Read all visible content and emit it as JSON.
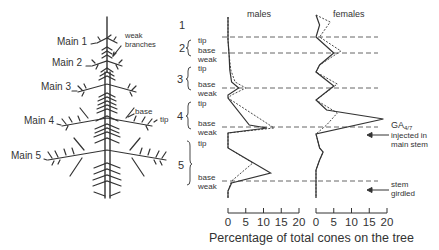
{
  "tree": {
    "labels": [
      {
        "text": "Main 1",
        "x": 57,
        "y": 45
      },
      {
        "text": "Main 2",
        "x": 52,
        "y": 66
      },
      {
        "text": "Main 3",
        "x": 41,
        "y": 90
      },
      {
        "text": "Main 4",
        "x": 24,
        "y": 124
      },
      {
        "text": "Main 5",
        "x": 11,
        "y": 159
      }
    ],
    "annotations": {
      "weak_branches_1": "weak",
      "weak_branches_2": "branches",
      "base": "base",
      "tip": "tip"
    }
  },
  "sections": [
    {
      "num": "1",
      "y": 27,
      "sub": []
    },
    {
      "num": "2",
      "y": 49,
      "sub": [
        {
          "t": "tip",
          "y": 43
        },
        {
          "t": "base",
          "y": 53
        },
        {
          "t": "weak",
          "y": 62
        }
      ]
    },
    {
      "num": "3",
      "y": 80,
      "sub": [
        {
          "t": "tip",
          "y": 71
        },
        {
          "t": "base",
          "y": 87
        },
        {
          "t": "weak",
          "y": 96
        }
      ]
    },
    {
      "num": "4",
      "y": 117,
      "sub": [
        {
          "t": "tip",
          "y": 106
        },
        {
          "t": "base",
          "y": 126
        },
        {
          "t": "weak",
          "y": 135
        }
      ]
    },
    {
      "num": "5",
      "y": 166,
      "sub": [
        {
          "t": "tip",
          "y": 146
        },
        {
          "t": "base",
          "y": 180
        },
        {
          "t": "weak",
          "y": 189
        }
      ]
    }
  ],
  "chart_data": {
    "type": "line",
    "title": "",
    "xlabel": "Percentage of total cones on the tree",
    "panels": [
      {
        "name": "males",
        "xlim": [
          0,
          20
        ],
        "xticks": [
          "0",
          "5",
          "10",
          "15",
          "20"
        ],
        "series": [
          {
            "name": "control (solid)",
            "style": "solid",
            "points": [
              [
                0,
                17
              ],
              [
                0,
                40
              ],
              [
                0.3,
                55
              ],
              [
                0.5,
                70
              ],
              [
                1,
                82
              ],
              [
                3,
                88
              ],
              [
                0,
                95
              ],
              [
                0,
                98
              ],
              [
                6,
                125
              ],
              [
                11,
                128
              ],
              [
                0,
                133
              ],
              [
                0,
                148
              ],
              [
                12,
                173
              ],
              [
                1,
                183
              ],
              [
                0,
                191
              ],
              [
                0,
                198
              ]
            ]
          },
          {
            "name": "treated (dashed)",
            "style": "dashed",
            "points": [
              [
                0,
                17
              ],
              [
                0,
                40
              ],
              [
                0.3,
                55
              ],
              [
                0.8,
                70
              ],
              [
                2,
                82
              ],
              [
                5,
                88
              ],
              [
                1,
                95
              ],
              [
                0,
                98
              ],
              [
                13,
                128
              ],
              [
                0,
                133
              ],
              [
                0,
                148
              ],
              [
                7,
                163
              ],
              [
                1,
                181
              ],
              [
                0,
                191
              ],
              [
                0,
                198
              ]
            ]
          }
        ]
      },
      {
        "name": "females",
        "xlim": [
          0,
          20
        ],
        "xticks": [
          "0",
          "5",
          "10",
          "15",
          "20"
        ],
        "series": [
          {
            "name": "control (solid)",
            "style": "solid",
            "points": [
              [
                0,
                15
              ],
              [
                1,
                25
              ],
              [
                0,
                37
              ],
              [
                5,
                53
              ],
              [
                1,
                65
              ],
              [
                0,
                72
              ],
              [
                5,
                86
              ],
              [
                0,
                100
              ],
              [
                3,
                110
              ],
              [
                19,
                119
              ],
              [
                0,
                134
              ],
              [
                1,
                148
              ],
              [
                2,
                152
              ],
              [
                1,
                160
              ],
              [
                0,
                170
              ],
              [
                0,
                198
              ]
            ]
          },
          {
            "name": "treated (dashed)",
            "style": "dashed",
            "points": [
              [
                0,
                15
              ],
              [
                4,
                22
              ],
              [
                1,
                37
              ],
              [
                7,
                51
              ],
              [
                1,
                65
              ],
              [
                0,
                72
              ],
              [
                6,
                84
              ],
              [
                0,
                100
              ],
              [
                6,
                113
              ],
              [
                3,
                125
              ],
              [
                0,
                134
              ],
              [
                1,
                148
              ],
              [
                2,
                152
              ],
              [
                1,
                160
              ],
              [
                0,
                170
              ],
              [
                0,
                198
              ]
            ]
          }
        ]
      }
    ],
    "section_boundaries_y": [
      37,
      53,
      88,
      127,
      181
    ],
    "annotations": [
      {
        "text": "GA4/7 injected in main stem",
        "y": 127
      },
      {
        "text": "stem girdled",
        "y": 181
      }
    ]
  },
  "chart_labels": {
    "males": "males",
    "females": "females",
    "xlabel": "Percentage of total cones on the tree",
    "ga_main": "GA",
    "ga_sub": "4/7",
    "injected_1": "injected in",
    "injected_2": "main stem",
    "girdled_1": "stem",
    "girdled_2": "girdled",
    "ticks": [
      "0",
      "5",
      "10",
      "15",
      "20"
    ]
  }
}
